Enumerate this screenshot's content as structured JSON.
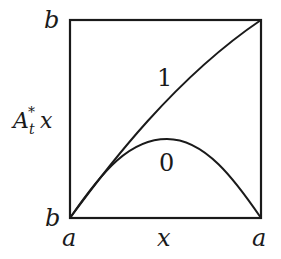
{
  "diagram": {
    "type": "function-graph-in-unit-square",
    "colors": {
      "line": "#1a1a1a",
      "background": "#ffffff"
    },
    "axes": {
      "x_left_label": "a",
      "x_mid_label": "x",
      "x_right_label": "a",
      "y_top_label": "b",
      "y_bottom_label": "b",
      "y_axis_label_main": "A",
      "y_axis_label_sup": "*",
      "y_axis_label_sub": "t",
      "y_axis_label_var": "x"
    },
    "curves": [
      {
        "label": "1",
        "description": "concave curve from bottom-left corner to top-right corner"
      },
      {
        "label": "0",
        "description": "arch from bottom-left corner to bottom-right corner, peak near middle"
      }
    ]
  }
}
